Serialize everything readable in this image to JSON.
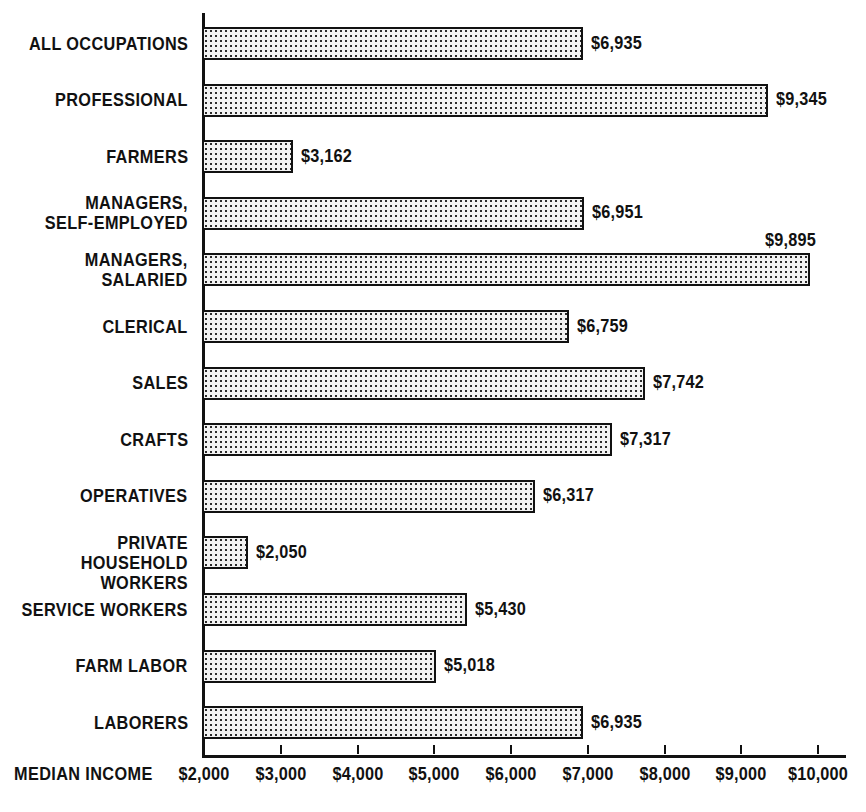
{
  "chart_data": {
    "type": "bar",
    "orientation": "horizontal",
    "title": "",
    "subtitle": "",
    "xlabel": "MEDIAN INCOME",
    "ylabel": "",
    "xlim": [
      2000,
      10000
    ],
    "grid": false,
    "legend": null,
    "xtick_labels": [
      "$2,000",
      "$3,000",
      "$4,000",
      "$5,000",
      "$6,000",
      "$7,000",
      "$8,000",
      "$9,000",
      "$10,000"
    ],
    "xticks": [
      2000,
      3000,
      4000,
      5000,
      6000,
      7000,
      8000,
      9000,
      10000
    ],
    "categories": [
      "ALL OCCUPATIONS",
      "PROFESSIONAL",
      "FARMERS",
      "MANAGERS,\nSELF-EMPLOYED",
      "MANAGERS,\nSALARIED",
      "CLERICAL",
      "SALES",
      "CRAFTS",
      "OPERATIVES",
      "PRIVATE HOUSEHOLD\nWORKERS",
      "SERVICE WORKERS",
      "FARM LABOR",
      "LABORERS"
    ],
    "values": [
      6935,
      9345,
      3162,
      6951,
      9895,
      6759,
      7742,
      7317,
      6317,
      2050,
      5430,
      5018,
      6935
    ],
    "value_labels": [
      "$6,935",
      "$9,345",
      "$3,162",
      "$6,951",
      "$9,895",
      "$6,759",
      "$7,742",
      "$7,317",
      "$6,317",
      "$2,050",
      "$5,430",
      "$5,018",
      "$6,935"
    ],
    "label_placement": [
      "right",
      "right",
      "right",
      "right",
      "above",
      "right",
      "right",
      "right",
      "right",
      "right",
      "right",
      "right",
      "right"
    ],
    "colors": {
      "bar_fill": "#f2f2f2",
      "bar_pattern": "#2b2b2b",
      "bar_border": "#111111",
      "axis": "#111111",
      "text": "#111111",
      "background": "#ffffff"
    }
  }
}
